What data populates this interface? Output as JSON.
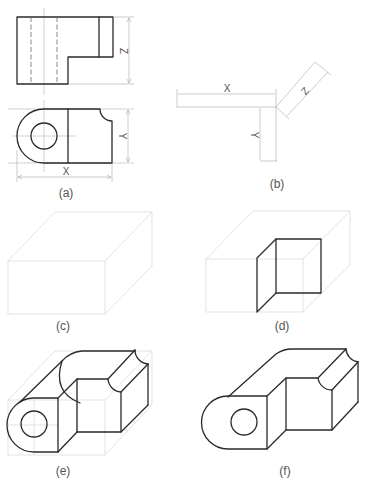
{
  "figure": {
    "panels": [
      {
        "id": "a",
        "label": "(a)",
        "description": "Orthographic front and top views with dimensions"
      },
      {
        "id": "b",
        "label": "(b)",
        "description": "Isometric axes with overall dimensions"
      },
      {
        "id": "c",
        "label": "(c)",
        "description": "Bounding box"
      },
      {
        "id": "d",
        "label": "(d)",
        "description": "Bounding box with front step face"
      },
      {
        "id": "e",
        "label": "(e)",
        "description": "Object construction within bounding box"
      },
      {
        "id": "f",
        "label": "(f)",
        "description": "Finished isometric drawing"
      }
    ],
    "dimensions": {
      "x": "X",
      "y": "Y",
      "z": "Z"
    },
    "colors": {
      "object_line": "#2a2a2a",
      "construction_line": "#bdbdbd",
      "dimension_line": "#a8a8a8",
      "label_text": "#555555"
    }
  }
}
